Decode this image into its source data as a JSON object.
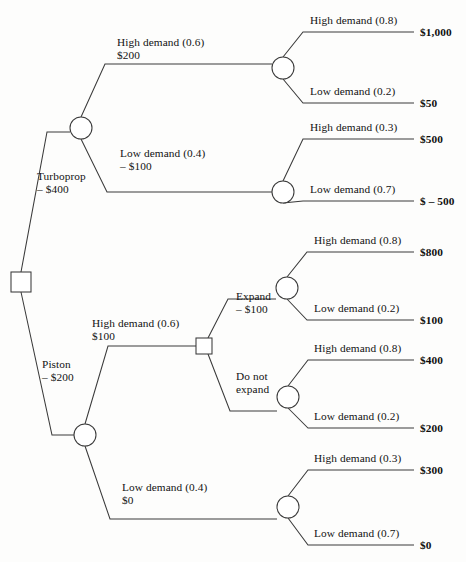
{
  "diagram": {
    "type": "decision-tree",
    "nodes": {
      "root": {
        "kind": "decision",
        "name": "root-decision-node"
      },
      "turboprop_chance": {
        "kind": "chance",
        "name": "turboprop-chance-node"
      },
      "piston_chance": {
        "kind": "chance",
        "name": "piston-chance-node"
      },
      "expand_decision": {
        "kind": "decision",
        "name": "expand-decision-node"
      },
      "tp_high_chance": {
        "kind": "chance",
        "name": "turboprop-high-demand-chance-node"
      },
      "tp_low_chance": {
        "kind": "chance",
        "name": "turboprop-low-demand-chance-node"
      },
      "expand_chance": {
        "kind": "chance",
        "name": "expand-chance-node"
      },
      "no_expand_chance": {
        "kind": "chance",
        "name": "do-not-expand-chance-node"
      },
      "piston_low_chance": {
        "kind": "chance",
        "name": "piston-low-demand-chance-node"
      }
    },
    "branch_labels": {
      "turboprop": {
        "line1": "Turboprop",
        "line2": "– $400"
      },
      "piston": {
        "line1": "Piston",
        "line2": "– $200"
      },
      "tp_high": {
        "line1": "High demand (0.6)",
        "line2": "$200"
      },
      "tp_low": {
        "line1": "Low demand (0.4)",
        "line2": "– $100"
      },
      "pi_high": {
        "line1": "High demand (0.6)",
        "line2": "$100"
      },
      "pi_low": {
        "line1": "Low demand (0.4)",
        "line2": "$0"
      },
      "expand": {
        "line1": "Expand",
        "line2": "– $100"
      },
      "do_not_expand": {
        "line1": "Do not",
        "line2": "expand"
      },
      "tp_high_high": {
        "line1": "High demand (0.8)"
      },
      "tp_high_low": {
        "line1": "Low demand (0.2)"
      },
      "tp_low_high": {
        "line1": "High demand (0.3)"
      },
      "tp_low_low": {
        "line1": "Low demand (0.7)"
      },
      "exp_high": {
        "line1": "High demand (0.8)"
      },
      "exp_low": {
        "line1": "Low demand (0.2)"
      },
      "noexp_high": {
        "line1": "High demand (0.8)"
      },
      "noexp_low": {
        "line1": "Low demand (0.2)"
      },
      "pi_low_high": {
        "line1": "High demand (0.3)"
      },
      "pi_low_low": {
        "line1": "Low demand (0.7)"
      }
    },
    "payoffs": {
      "p1": "$1,000",
      "p2": "$50",
      "p3": "$500",
      "p4": "$ – 500",
      "p5": "$800",
      "p6": "$100",
      "p7": "$400",
      "p8": "$200",
      "p9": "$300",
      "p10": "$0"
    },
    "colors": {
      "stroke": "#3a3a3a",
      "text": "#121212",
      "background": "#fdfdfc"
    }
  }
}
